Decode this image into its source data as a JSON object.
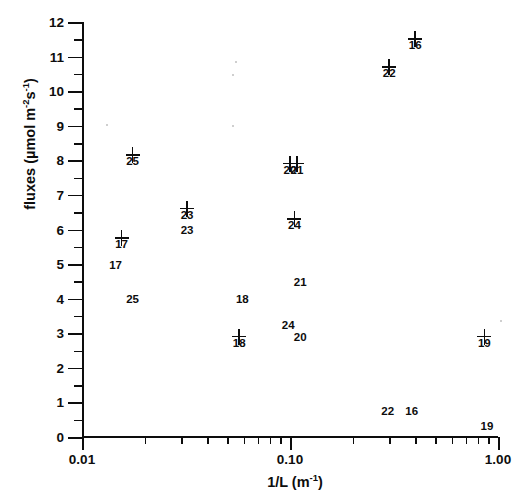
{
  "chart_data": {
    "type": "scatter",
    "title": "",
    "xlabel": "1/L (m-1)",
    "ylabel": "fluxes (umol m-2s-1)",
    "xscale": "log",
    "yscale": "linear",
    "xlim": [
      0.01,
      1.0
    ],
    "ylim": [
      0,
      12
    ],
    "grid": false,
    "legend": false,
    "marker": "plus-cross",
    "x_tick_labels": [
      "0.01",
      "0.10",
      "1.00"
    ],
    "x_tick_values": [
      0.01,
      0.1,
      1.0
    ],
    "y_tick_labels": [
      "0",
      "1",
      "2",
      "3",
      "4",
      "5",
      "6",
      "7",
      "8",
      "9",
      "10",
      "11",
      "12"
    ],
    "y_tick_values": [
      0,
      1,
      2,
      3,
      4,
      5,
      6,
      7,
      8,
      9,
      10,
      11,
      12
    ],
    "y_minor_ticks": [
      0.5,
      1.5,
      2.5,
      3.5,
      4.5,
      5.5,
      6.5,
      7.5,
      8.5,
      9.5,
      10.5,
      11.5
    ],
    "points": [
      {
        "label": "25",
        "x": 0.0175,
        "y": 8.15
      },
      {
        "label": "17",
        "x": 0.0155,
        "y": 5.75
      },
      {
        "label": "23",
        "x": 0.032,
        "y": 6.6
      },
      {
        "label": "18",
        "x": 0.057,
        "y": 2.9
      },
      {
        "label": "24",
        "x": 0.105,
        "y": 6.3
      },
      {
        "label": "20",
        "x": 0.1,
        "y": 7.9
      },
      {
        "label": "21",
        "x": 0.108,
        "y": 7.9
      },
      {
        "label": "22",
        "x": 0.3,
        "y": 10.7
      },
      {
        "label": "16",
        "x": 0.4,
        "y": 11.5
      },
      {
        "label": "19",
        "x": 0.86,
        "y": 2.9
      }
    ],
    "annotations": [
      {
        "text": "17",
        "x": 0.0145,
        "y": 4.95
      },
      {
        "text": "25",
        "x": 0.0175,
        "y": 3.95
      },
      {
        "text": "23",
        "x": 0.032,
        "y": 5.95
      },
      {
        "text": "18",
        "x": 0.059,
        "y": 3.95
      },
      {
        "text": "21",
        "x": 0.112,
        "y": 4.45
      },
      {
        "text": "24",
        "x": 0.098,
        "y": 3.2
      },
      {
        "text": "20",
        "x": 0.112,
        "y": 2.85
      },
      {
        "text": "22",
        "x": 0.295,
        "y": 0.72
      },
      {
        "text": "16",
        "x": 0.385,
        "y": 0.72
      },
      {
        "text": "19",
        "x": 0.885,
        "y": 0.28
      }
    ]
  },
  "axes": {
    "y_title_prefix": "fluxes (",
    "y_title_mu": "µ",
    "y_title_mid": "mol  m",
    "y_title_exp1": "-2",
    "y_title_s": "s",
    "y_title_exp2": "-1",
    "y_title_suffix": ")",
    "x_title_main": "1/L (m",
    "x_title_exp": "-1",
    "x_title_suffix": ")"
  }
}
